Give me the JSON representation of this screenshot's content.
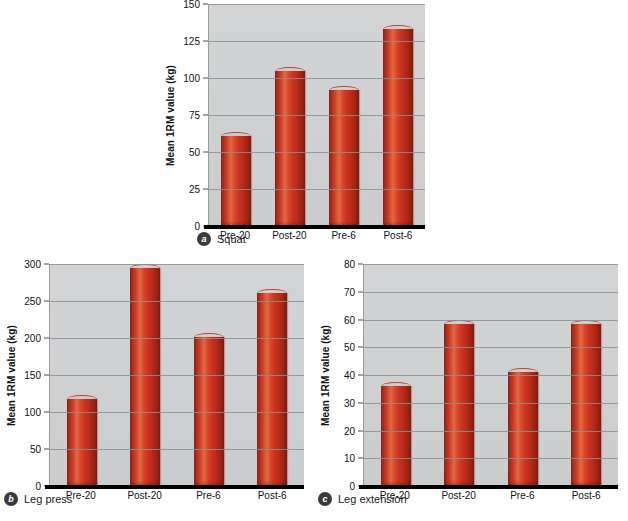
{
  "figure": {
    "panels": [
      "a",
      "b",
      "c"
    ]
  },
  "charts": [
    {
      "id": "a",
      "badge": "a",
      "caption": "Squat",
      "ylabel": "Mean 1RM value (kg)"
    },
    {
      "id": "b",
      "badge": "b",
      "caption": "Leg press",
      "ylabel": "Mean 1RM value (kg)"
    },
    {
      "id": "c",
      "badge": "c",
      "caption": "Leg extension",
      "ylabel": "Mean 1RM value (kg)"
    }
  ],
  "chart_data": [
    {
      "type": "bar",
      "title": "Squat",
      "panel_label": "a",
      "categories": [
        "Pre-20",
        "Post-20",
        "Pre-6",
        "Post-6"
      ],
      "values": [
        61,
        105,
        92,
        133
      ],
      "xlabel": "",
      "ylabel": "Mean 1RM value (kg)",
      "ylim": [
        0,
        150
      ],
      "yticks": [
        0,
        25,
        50,
        75,
        100,
        125,
        150
      ],
      "grid": true,
      "legend": false,
      "bar_color": "#c83a22"
    },
    {
      "type": "bar",
      "title": "Leg press",
      "panel_label": "b",
      "categories": [
        "Pre-20",
        "Post-20",
        "Pre-6",
        "Post-6"
      ],
      "values": [
        118,
        295,
        201,
        261
      ],
      "xlabel": "",
      "ylabel": "Mean 1RM value (kg)",
      "ylim": [
        0,
        300
      ],
      "yticks": [
        0,
        50,
        100,
        150,
        200,
        250,
        300
      ],
      "grid": true,
      "legend": false,
      "bar_color": "#c83a22"
    },
    {
      "type": "bar",
      "title": "Leg extension",
      "panel_label": "c",
      "categories": [
        "Pre-20",
        "Post-20",
        "Pre-6",
        "Post-6"
      ],
      "values": [
        36,
        58.5,
        41,
        58.5
      ],
      "xlabel": "",
      "ylabel": "Mean 1RM value (kg)",
      "ylim": [
        0,
        80
      ],
      "yticks": [
        0,
        10,
        20,
        30,
        40,
        50,
        60,
        70,
        80
      ],
      "grid": true,
      "legend": false,
      "bar_color": "#c83a22"
    }
  ],
  "colors": {
    "bar": "#c83a22",
    "plot_background": "#d0d1d3",
    "gridline": "#8d8e90",
    "axis": "#000000",
    "text": "#1a1a1a"
  }
}
